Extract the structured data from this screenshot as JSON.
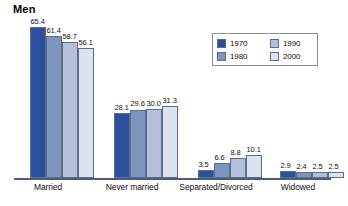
{
  "chart_data": {
    "type": "bar",
    "title": "Men",
    "xlabel": "",
    "ylabel": "",
    "ylim": [
      0,
      70
    ],
    "grid": false,
    "legend_position": "top-right",
    "categories": [
      "Married",
      "Never married",
      "Separated/Divorced",
      "Widowed"
    ],
    "series": [
      {
        "name": "1970",
        "color": "#2c4f9e",
        "values": [
          65.4,
          28.1,
          3.5,
          2.9
        ]
      },
      {
        "name": "1980",
        "color": "#7f94bd",
        "values": [
          61.4,
          29.6,
          6.6,
          2.4
        ]
      },
      {
        "name": "1990",
        "color": "#b4c0d9",
        "values": [
          58.7,
          30.0,
          8.8,
          2.5
        ]
      },
      {
        "name": "2000",
        "color": "#dde3ee",
        "values": [
          56.1,
          31.3,
          10.1,
          2.5
        ]
      }
    ],
    "value_labels": [
      [
        "65.4",
        "61.4",
        "58.7",
        "56.1"
      ],
      [
        "28.1",
        "29.6",
        "30.0",
        "31.3"
      ],
      [
        "3.5",
        "6.6",
        "8.8",
        "10.1"
      ],
      [
        "2.9",
        "2.4",
        "2.5",
        "2.5"
      ]
    ]
  },
  "legend": {
    "items": [
      {
        "label": "1970"
      },
      {
        "label": "1990"
      },
      {
        "label": "1980"
      },
      {
        "label": "2000"
      }
    ]
  }
}
